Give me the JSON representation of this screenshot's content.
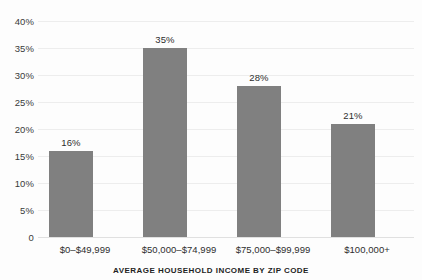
{
  "chart_data": {
    "type": "bar",
    "title": "",
    "xlabel": "AVERAGE HOUSEHOLD INCOME BY ZIP CODE",
    "ylabel": "",
    "categories": [
      "$0–$49,999",
      "$50,000–$74,999",
      "$75,000–$99,999",
      "$100,000+"
    ],
    "values": [
      16,
      35,
      28,
      21
    ],
    "value_labels": [
      "16%",
      "35%",
      "28%",
      "21%"
    ],
    "ylim": [
      0,
      40
    ],
    "ytick_values": [
      40,
      35,
      30,
      25,
      20,
      15,
      10,
      5,
      0
    ],
    "ytick_labels": [
      "40%",
      "35%",
      "30%",
      "25%",
      "20%",
      "15%",
      "10%",
      "5%",
      "0"
    ],
    "grid": true,
    "grid_axis": "y",
    "legend": false,
    "bar_color": "#808080",
    "grid_color": "#ededed",
    "background_color": "#fdfdfd",
    "text_color": "#2e2e2e"
  }
}
